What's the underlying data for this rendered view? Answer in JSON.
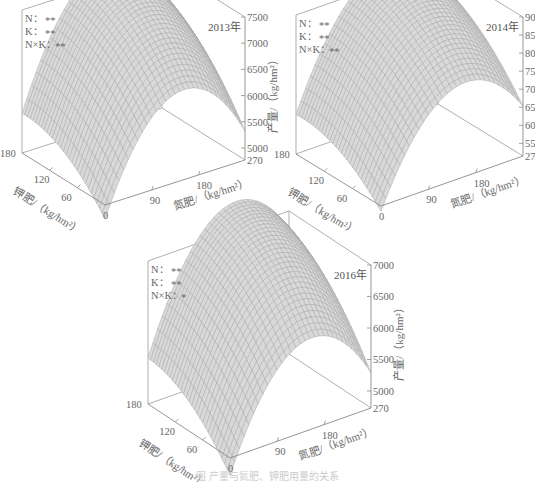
{
  "caption": "图 产量与氮肥、钾肥用量的关系",
  "chart_data": [
    {
      "type": "surface3d",
      "title": "2013年",
      "significance": [
        {
          "label": "N：",
          "value": "**"
        },
        {
          "label": "K：",
          "value": "**"
        },
        {
          "label": "N×K：",
          "value": "**"
        }
      ],
      "xlabel": "氮肥/（kg/hm²）",
      "ylabel": "钾肥/（kg/hm²）",
      "zlabel": "产量/（kg/hm²）",
      "x_ticks": [
        0,
        90,
        180,
        270
      ],
      "y_ticks": [
        60,
        120,
        180
      ],
      "z_ticks": [
        5000,
        5500,
        6000,
        6500,
        7000,
        7500
      ],
      "xlim": [
        0,
        270
      ],
      "ylim": [
        0,
        180
      ],
      "zlim": [
        4770,
        7500
      ],
      "surface_model": {
        "a": 4500,
        "bN": 26.0,
        "cN2": 0.085,
        "dK": 12.0,
        "eK2": 0.035,
        "fNK": 0.012
      },
      "peak_yield_approx": 7450
    },
    {
      "type": "surface3d",
      "title": "2014年",
      "significance": [
        {
          "label": "N：",
          "value": "**"
        },
        {
          "label": "K：",
          "value": "**"
        },
        {
          "label": "N×K：",
          "value": "**"
        }
      ],
      "xlabel": "氮肥/（kg/hm²）",
      "ylabel": "钾肥/（kg/hm²）",
      "zlabel": "产量/（kg/hm²）",
      "x_ticks": [
        0,
        90,
        180,
        270
      ],
      "y_ticks": [
        60,
        120,
        180
      ],
      "z_ticks": [
        5500,
        6000,
        6500,
        7000,
        7500,
        8000,
        8500,
        9000
      ],
      "xlim": [
        0,
        270
      ],
      "ylim": [
        0,
        180
      ],
      "zlim": [
        5150,
        9000
      ],
      "surface_model": {
        "a": 5000,
        "bN": 34.0,
        "cN2": 0.105,
        "dK": 15.0,
        "eK2": 0.045,
        "fNK": 0.016
      },
      "peak_yield_approx": 8950
    },
    {
      "type": "surface3d",
      "title": "2016年",
      "significance": [
        {
          "label": "N：",
          "value": "**"
        },
        {
          "label": "K：",
          "value": "**"
        },
        {
          "label": "N×K：",
          "value": "*"
        }
      ],
      "xlabel": "氮肥/（kg/hm²）",
      "ylabel": "钾肥/（kg/hm²）",
      "zlabel": "产量/（kg/hm²）",
      "x_ticks": [
        0,
        90,
        180,
        270
      ],
      "y_ticks": [
        60,
        120,
        180
      ],
      "z_ticks": [
        5000,
        5500,
        6000,
        6500,
        7000
      ],
      "xlim": [
        0,
        270
      ],
      "ylim": [
        0,
        180
      ],
      "zlim": [
        4730,
        7000
      ],
      "surface_model": {
        "a": 4450,
        "bN": 22.0,
        "cN2": 0.07,
        "dK": 11.0,
        "eK2": 0.03,
        "fNK": 0.009
      },
      "peak_yield_approx": 6980
    }
  ],
  "panels": [
    {
      "left": 0,
      "top": 0,
      "origin": [
        105,
        210
      ],
      "kEnd": [
        22,
        158
      ],
      "nEnd": [
        245,
        165
      ],
      "zTop": 17,
      "zBottom": 160
    },
    {
      "left": 278,
      "top": 0,
      "origin": [
        103,
        210
      ],
      "kEnd": [
        18,
        158
      ],
      "nEnd": [
        245,
        160
      ],
      "zTop": 17,
      "zBottom": 156
    },
    {
      "left": 128,
      "top": 248,
      "origin": [
        102,
        214
      ],
      "kEnd": [
        20,
        160
      ],
      "nEnd": [
        243,
        164
      ],
      "zTop": 17,
      "zBottom": 160
    }
  ]
}
